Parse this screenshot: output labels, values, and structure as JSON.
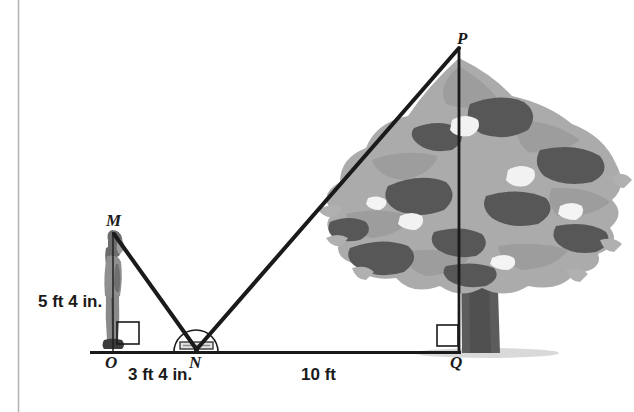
{
  "figure": {
    "type": "geometry-diagram",
    "topic": "indirect measurement using a mirror (similar triangles)",
    "background_color": "#ffffff",
    "ink_color": "#1a1a1a",
    "border_rule_color": "#b4b4b4"
  },
  "points": {
    "M": {
      "label": "M",
      "x": 113,
      "y": 232,
      "label_x": 106,
      "label_y": 212,
      "meaning": "top of the person's head"
    },
    "O": {
      "label": "O",
      "x": 113,
      "y": 352,
      "label_x": 106,
      "label_y": 355,
      "meaning": "person's feet on the ground"
    },
    "N": {
      "label": "N",
      "x": 196,
      "y": 352,
      "label_x": 189,
      "label_y": 355,
      "meaning": "mirror on the ground"
    },
    "P": {
      "label": "P",
      "x": 459,
      "y": 48,
      "label_x": 456,
      "label_y": 30,
      "meaning": "top of the tree"
    },
    "Q": {
      "label": "Q",
      "x": 459,
      "y": 352,
      "label_x": 450,
      "label_y": 355,
      "meaning": "base of the tree"
    }
  },
  "measurements": [
    {
      "id": "person-height",
      "text": "5 ft 4 in.",
      "x": 38,
      "y": 293,
      "describes": "segment MO, the person's height"
    },
    {
      "id": "o-to-n",
      "text": "3 ft 4 in.",
      "x": 128,
      "y": 366,
      "describes": "segment ON, feet to mirror"
    },
    {
      "id": "n-to-q",
      "text": "10 ft",
      "x": 301,
      "y": 366,
      "describes": "segment NQ, mirror to tree"
    }
  ],
  "segments": [
    {
      "id": "ground-line",
      "from": "left-edge",
      "to": "Q",
      "x1": 90,
      "y1": 352,
      "x2": 461,
      "y2": 352,
      "width": 3
    },
    {
      "id": "person-height-line",
      "from": "M",
      "to": "O",
      "x1": 113,
      "y1": 232,
      "x2": 113,
      "y2": 352,
      "width": 1
    },
    {
      "id": "sight-line-m-n",
      "from": "M",
      "to": "N",
      "x1": 114,
      "y1": 234,
      "x2": 196,
      "y2": 350,
      "width": 4
    },
    {
      "id": "sight-line-n-p",
      "from": "N",
      "to": "P",
      "x1": 196,
      "y1": 350,
      "x2": 459,
      "y2": 48,
      "width": 4
    },
    {
      "id": "tree-height-line",
      "from": "P",
      "to": "Q",
      "x1": 459,
      "y1": 48,
      "x2": 459,
      "y2": 352,
      "width": 3
    }
  ],
  "marks": {
    "right_angle_at_O": {
      "x": 117,
      "y": 322,
      "size": 22,
      "note": "square mark showing MO perpendicular to ground"
    },
    "right_angle_at_Q": {
      "x": 437,
      "y": 325,
      "size": 21,
      "note": "square mark showing PQ perpendicular to ground"
    },
    "mirror_arc_at_N": {
      "cx": 196,
      "cy": 352,
      "r": 22,
      "note": "semicircular protractor arc over the mirror"
    },
    "mirror_plate_at_N": {
      "x": 180,
      "y": 342,
      "width": 33,
      "height": 7,
      "note": "small mirror lying flat on the ground"
    }
  },
  "objects": {
    "person": {
      "name": "person standing at O",
      "x": 100,
      "y": 238,
      "width": 26,
      "height": 114,
      "colors": {
        "hair": "#6b6b6b",
        "body": "#9a9a9a",
        "shade": "#6f6f6f",
        "shoe": "#3a3a3a"
      }
    },
    "tree": {
      "name": "tree rooted at Q",
      "canopy_bounds": {
        "x": 336,
        "y": 62,
        "width": 290,
        "height": 260
      },
      "trunk_bounds": {
        "x": 459,
        "y": 200,
        "width": 32,
        "height": 152
      },
      "colors": {
        "canopy_light": "#a9a9a9",
        "canopy_mid": "#8c8c8c",
        "canopy_dark": "#555555",
        "trunk": "#585858",
        "branch": "#6a6a6a",
        "shadow": "#c9c9c9"
      }
    }
  },
  "border_rule": {
    "x": 18,
    "y1": 0,
    "y2": 412
  }
}
